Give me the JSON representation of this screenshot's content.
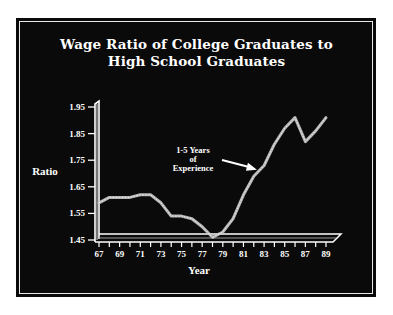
{
  "chart_data": {
    "type": "line",
    "title": "Wage Ratio of College Graduates to High School Graduates",
    "title_lines": [
      "Wage Ratio of College Graduates to",
      "High School Graduates"
    ],
    "xlabel": "Year",
    "ylabel": "Ratio",
    "x_tick_labels": [
      "67",
      "69",
      "71",
      "73",
      "75",
      "77",
      "79",
      "81",
      "83",
      "85",
      "87",
      "89"
    ],
    "y_tick_labels": [
      "1.95",
      "1.85",
      "1.75",
      "1.65",
      "1.55",
      "1.45"
    ],
    "ylim": [
      1.45,
      1.95
    ],
    "xlim": [
      67,
      89
    ],
    "grid": false,
    "legend": null,
    "series": [
      {
        "name": "Wage Ratio",
        "x": [
          67,
          68,
          69,
          70,
          71,
          72,
          73,
          74,
          75,
          76,
          77,
          78,
          79,
          80,
          81,
          82,
          83,
          84,
          85,
          86,
          87,
          88,
          89
        ],
        "values": [
          1.59,
          1.61,
          1.61,
          1.61,
          1.62,
          1.62,
          1.59,
          1.54,
          1.54,
          1.53,
          1.5,
          1.46,
          1.48,
          1.53,
          1.62,
          1.69,
          1.73,
          1.81,
          1.87,
          1.91,
          1.82,
          1.86,
          1.91
        ]
      }
    ],
    "annotations": [
      {
        "text_lines": [
          "1-5 Years",
          "of",
          "Experience"
        ],
        "points_to_x": 82.5,
        "points_to_y": 1.71
      }
    ]
  },
  "colors": {
    "background": "#0a0a0a",
    "foreground": "#ffffff",
    "line": "#c8c8c8",
    "page": "#ffffff"
  }
}
